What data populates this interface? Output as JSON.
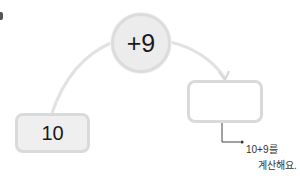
{
  "operation": {
    "label": "+9"
  },
  "start_box": {
    "value": "10"
  },
  "answer_box": {
    "value": ""
  },
  "hint": {
    "line1": "10+9를",
    "line2": "계산해요."
  },
  "colors": {
    "box_fill": "#efefef",
    "box_border": "#dadada",
    "wire": "#e2e2e2",
    "text": "#1a1a1a"
  }
}
